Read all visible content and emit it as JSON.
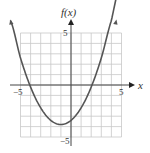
{
  "chart_data": {
    "type": "line",
    "title": "",
    "xlabel": "x",
    "ylabel": "f(x)",
    "xlim": [
      -5,
      5
    ],
    "ylim": [
      -5,
      5
    ],
    "grid": true,
    "x_ticks_labeled": [
      "-5",
      "5"
    ],
    "y_ticks_labeled": [
      "5",
      "-5"
    ],
    "series": [
      {
        "name": "f(x)",
        "description": "upward-opening parabola, vertex near (-1, -3.8), x-intercepts near -4.1 and 2.1, arrows on both ends",
        "x": [
          -6.0,
          -5.0,
          -4.0,
          -3.0,
          -2.0,
          -1.0,
          0.0,
          1.0,
          2.0,
          3.0,
          4.0,
          4.5
        ],
        "values": [
          6.2,
          2.6,
          -0.2,
          -2.2,
          -3.4,
          -3.8,
          -3.4,
          -2.2,
          -0.2,
          2.6,
          6.2,
          8.3
        ]
      }
    ]
  },
  "labels": {
    "y_axis": "f(x)",
    "x_axis": "x",
    "x_min": "−5",
    "x_max": "5",
    "y_max": "5",
    "y_min": "−5"
  }
}
